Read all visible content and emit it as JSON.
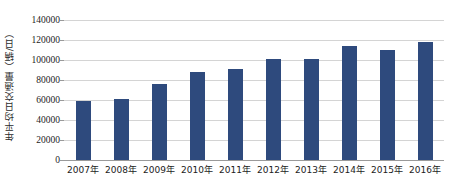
{
  "chart_data": {
    "type": "bar",
    "title": "",
    "subtitle": "",
    "xlabel": "",
    "ylabel": "年平均日交通量（辆/日）",
    "categories": [
      "2007年",
      "2008年",
      "2009年",
      "2010年",
      "2011年",
      "2012年",
      "2013年",
      "2014年",
      "2015年",
      "2016年"
    ],
    "values": [
      59000,
      61000,
      76000,
      88000,
      91000,
      101000,
      101000,
      114000,
      110000,
      118000
    ],
    "ylim": [
      0,
      140000
    ],
    "ytick_values": [
      0,
      20000,
      40000,
      60000,
      80000,
      100000,
      120000,
      140000
    ],
    "ytick_labels": [
      "0",
      "20000",
      "40000",
      "60000",
      "80000",
      "100000",
      "120000",
      "140000"
    ],
    "grid": true,
    "legend": false,
    "legend_position": "none",
    "series": [
      {
        "name": "年平均日交通量",
        "values": [
          59000,
          61000,
          76000,
          88000,
          91000,
          101000,
          101000,
          114000,
          110000,
          118000
        ]
      }
    ],
    "colors": {
      "bar": "#2e4a7d",
      "gridline": "#d4d4d4",
      "axis": "#9a9a9a",
      "text": "#1c1c1c",
      "background": "#ffffff"
    }
  }
}
